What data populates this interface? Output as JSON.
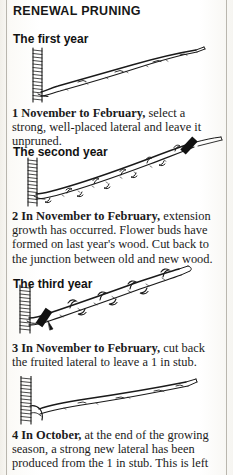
{
  "page": {
    "title": "RENEWAL PRUNING",
    "background_color": "#ffffff",
    "ink_color": "#1b1b1b",
    "gutter_line_color": "#b9b6ae"
  },
  "sections": [
    {
      "heading": "The first year",
      "figure_name": "first-year-pruning-diagram",
      "caption_bold": "1 November to February,",
      "caption_rest": " select a strong, well-placed lateral and leave it unpruned."
    },
    {
      "heading": "The second year",
      "figure_name": "second-year-pruning-diagram",
      "caption_bold": "2 In November to February,",
      "caption_rest": " extension growth has occurred. Flower buds have formed on last year's wood. Cut back to the junction between old and new wood."
    },
    {
      "heading": "The third year",
      "figure_name": "third-year-pruning-diagram",
      "caption_bold": "3 In November to February,",
      "caption_rest": " cut back the fruited lateral to leave a 1 in stub."
    },
    {
      "heading": "",
      "figure_name": "fourth-stage-pruning-diagram",
      "caption_bold": "4 In October,",
      "caption_rest": " at the end of the growing season, a strong new lateral has been produced from the 1 in stub. This is left"
    }
  ]
}
